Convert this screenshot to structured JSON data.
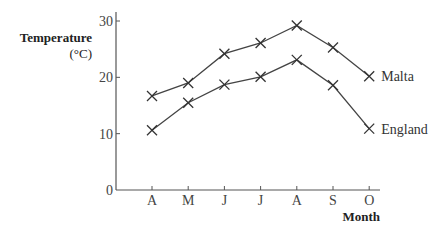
{
  "chart_data": {
    "type": "line",
    "title": "",
    "xlabel": "Month",
    "ylabel": "Temperature",
    "ylabel_unit": "(°C)",
    "categories": [
      "A",
      "M",
      "J",
      "J",
      "A",
      "S",
      "O"
    ],
    "series": [
      {
        "name": "Malta",
        "values": [
          16.7,
          19.0,
          24.2,
          26.1,
          29.2,
          25.3,
          20.2
        ]
      },
      {
        "name": "England",
        "values": [
          10.6,
          15.5,
          18.7,
          20.1,
          23.1,
          18.6,
          10.9
        ]
      }
    ],
    "ylim": [
      0,
      30
    ],
    "yticks": [
      0,
      10,
      20,
      30
    ],
    "marker": "x",
    "grid": false,
    "legend": "inline labels at line ends (right)"
  },
  "colors": {
    "line": "#444444",
    "axis": "#555555",
    "text": "#333333"
  }
}
